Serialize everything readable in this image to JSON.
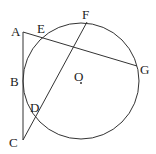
{
  "diagram": {
    "type": "geometry",
    "stroke_color": "#333333",
    "circle": {
      "center_label": "O",
      "cx": 81,
      "cy": 81,
      "r": 58
    },
    "points": {
      "A": {
        "label": "A",
        "x": 23,
        "y": 32,
        "lx": 11,
        "ly": 36
      },
      "B": {
        "label": "B",
        "x": 23,
        "y": 81,
        "lx": 10,
        "ly": 86
      },
      "C": {
        "label": "C",
        "x": 23,
        "y": 140,
        "lx": 9,
        "ly": 147
      },
      "D": {
        "label": "D",
        "x": 36,
        "y": 115,
        "lx": 31,
        "ly": 112
      },
      "E": {
        "label": "E",
        "x": 43,
        "y": 37,
        "lx": 37,
        "ly": 33
      },
      "F": {
        "label": "F",
        "x": 87,
        "y": 22,
        "lx": 82,
        "ly": 19
      },
      "G": {
        "label": "G",
        "x": 137,
        "y": 66,
        "lx": 140,
        "ly": 74
      },
      "O": {
        "label": "O",
        "x": 81,
        "y": 83,
        "lx": 74,
        "ly": 80
      }
    },
    "segments": [
      {
        "name": "AC",
        "from": "A",
        "to": "C"
      },
      {
        "name": "AG",
        "from": "A",
        "to": "G"
      },
      {
        "name": "CF",
        "from": "C",
        "to": "F"
      }
    ]
  }
}
